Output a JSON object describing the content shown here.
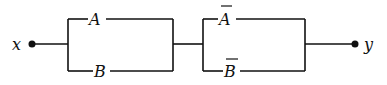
{
  "diagram": {
    "type": "switching-circuit",
    "input_terminal": {
      "label": "x"
    },
    "output_terminal": {
      "label": "y"
    },
    "blocks": [
      {
        "name": "parallel-block-1",
        "branches": [
          {
            "label": "A",
            "negated": false
          },
          {
            "label": "B",
            "negated": false
          }
        ]
      },
      {
        "name": "parallel-block-2",
        "branches": [
          {
            "label": "A",
            "negated": true
          },
          {
            "label": "B",
            "negated": true
          }
        ]
      }
    ],
    "connection": "series"
  },
  "colors": {
    "ink": "#111111",
    "background": "#ffffff"
  }
}
